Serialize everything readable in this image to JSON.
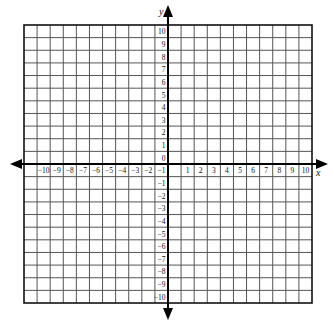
{
  "diagram": {
    "type": "coordinate-plane",
    "axes": {
      "x_label": "x",
      "y_label": "y",
      "x_range": [
        -11,
        11
      ],
      "y_range": [
        -11,
        11
      ],
      "x_tick_labels": [
        "-10",
        "-9",
        "-8",
        "-7",
        "-6",
        "-5",
        "-4",
        "-3",
        "-2",
        "-1",
        "1",
        "2",
        "3",
        "4",
        "5",
        "6",
        "7",
        "8",
        "9",
        "10"
      ],
      "y_tick_labels": [
        "10",
        "9",
        "8",
        "7",
        "6",
        "5",
        "4",
        "3",
        "2",
        "1",
        "0",
        "-1",
        "-2",
        "-3",
        "-4",
        "-5",
        "-6",
        "-7",
        "-8",
        "-9",
        "-10"
      ],
      "origin_label": "0",
      "arrows": [
        "left",
        "right",
        "up",
        "down"
      ]
    },
    "grid": {
      "columns": 22,
      "rows": 22,
      "left": 24,
      "top": 25,
      "right": 312,
      "bottom": 303,
      "line_color": "#555555",
      "axis_color": "#000000",
      "background": "#ffffff"
    }
  }
}
